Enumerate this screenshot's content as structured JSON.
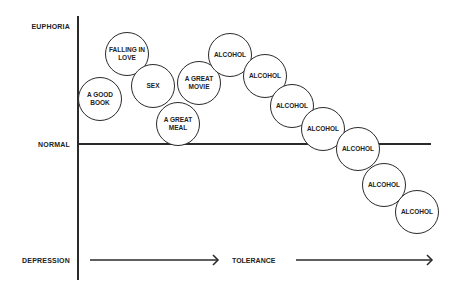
{
  "diagram": {
    "y_axis_labels": {
      "top": "EUPHORIA",
      "middle": "NORMAL",
      "bottom": "DEPRESSION"
    },
    "x_axis_label": "TOLERANCE",
    "bubbles": [
      {
        "label": "A GOOD BOOK",
        "cx": 100,
        "cy": 99
      },
      {
        "label": "FALLING IN LOVE",
        "cx": 127,
        "cy": 54
      },
      {
        "label": "SEX",
        "cx": 153,
        "cy": 86
      },
      {
        "label": "A GREAT MEAL",
        "cx": 178,
        "cy": 124
      },
      {
        "label": "A GREAT MOVIE",
        "cx": 199,
        "cy": 83
      },
      {
        "label": "ALCOHOL",
        "cx": 230,
        "cy": 55
      },
      {
        "label": "ALCOHOL",
        "cx": 265,
        "cy": 76
      },
      {
        "label": "ALCOHOL",
        "cx": 292,
        "cy": 106
      },
      {
        "label": "ALCOHOL",
        "cx": 323,
        "cy": 129
      },
      {
        "label": "ALCOHOL",
        "cx": 358,
        "cy": 149
      },
      {
        "label": "ALCOHOL",
        "cx": 384,
        "cy": 185
      },
      {
        "label": "ALCOHOL",
        "cx": 417,
        "cy": 212
      }
    ]
  }
}
